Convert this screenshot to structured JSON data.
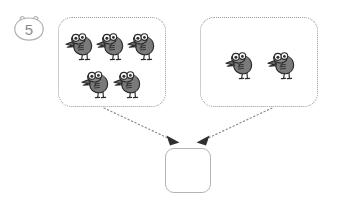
{
  "page": {
    "width": 338,
    "height": 202,
    "background_color": "#ffffff",
    "kind": "worksheet-addition-grouping"
  },
  "question": {
    "number_label": "5",
    "badge_shape": "bear-head-outline",
    "badge_color": "#8c8c8c"
  },
  "groups": [
    {
      "id": "left",
      "label": "",
      "count": 5,
      "item_icon": "bird-icon",
      "border_style": "dotted",
      "border_color": "#9a9a9a",
      "rows": [
        3,
        2
      ]
    },
    {
      "id": "right",
      "label": "",
      "count": 2,
      "item_icon": "bird-icon",
      "border_style": "dotted",
      "border_color": "#9a9a9a",
      "rows": [
        2
      ]
    }
  ],
  "answer": {
    "value": "",
    "placeholder": "",
    "border_color": "#b4b4b4"
  },
  "arrows": [
    {
      "from_group": "left",
      "direction": "down-right",
      "style": "dotted",
      "head": "solid-triangle",
      "color": "#8a8a8a"
    },
    {
      "from_group": "right",
      "direction": "down-left",
      "style": "dotted",
      "head": "solid-triangle",
      "color": "#8a8a8a"
    }
  ],
  "colors": {
    "bird_body": "#7a7a7a",
    "bird_outline": "#2b2b2b",
    "bird_eye_white": "#ffffff",
    "bird_beak": "#6e6e6e",
    "dotted_border": "#9a9a9a",
    "answer_border": "#b4b4b4"
  }
}
